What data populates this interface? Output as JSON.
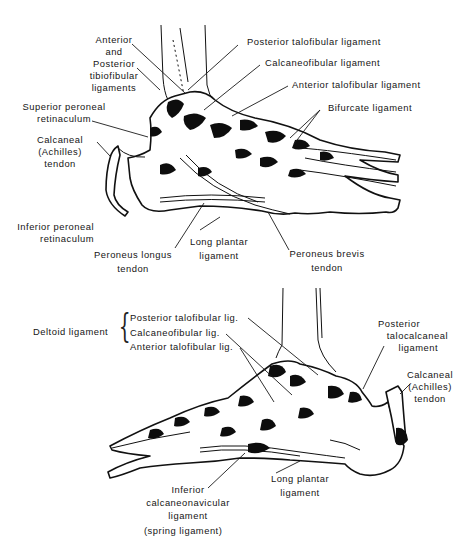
{
  "figure": {
    "top_view": {
      "description": "Lateral view of ankle and foot ligaments",
      "labels": [
        {
          "id": "ant-post-tibiofibular",
          "lines": [
            "Anterior",
            "and",
            "Posterior",
            "tibiofibular",
            "ligaments"
          ]
        },
        {
          "id": "superior-peroneal-retinaculum",
          "lines": [
            "Superior peroneal",
            "retinaculum"
          ]
        },
        {
          "id": "calcaneal-achilles-tendon",
          "lines": [
            "Calcaneal",
            "(Achilles)",
            "tendon"
          ]
        },
        {
          "id": "inferior-peroneal-retinaculum",
          "lines": [
            "Inferior peroneal",
            "retinaculum"
          ]
        },
        {
          "id": "peroneus-longus-tendon",
          "lines": [
            "Peroneus longus",
            "tendon"
          ]
        },
        {
          "id": "long-plantar-ligament",
          "lines": [
            "Long plantar",
            "ligament"
          ]
        },
        {
          "id": "peroneus-brevis-tendon",
          "lines": [
            "Peroneus brevis",
            "tendon"
          ]
        },
        {
          "id": "posterior-talofibular-ligament",
          "lines": [
            "Posterior talofibular ligament"
          ]
        },
        {
          "id": "calcaneofibular-ligament",
          "lines": [
            "Calcaneofibular ligament"
          ]
        },
        {
          "id": "anterior-talofibular-ligament",
          "lines": [
            "Anterior talofibular ligament"
          ]
        },
        {
          "id": "bifurcate-ligament",
          "lines": [
            "Bifurcate ligament"
          ]
        }
      ]
    },
    "bottom_view": {
      "description": "Medial view of ankle and foot ligaments",
      "group_label": "Deltoid ligament",
      "group_items": [
        "Posterior talofibular lig.",
        "Calcaneofibular lig.",
        "Anterior talofibular lig."
      ],
      "labels": [
        {
          "id": "posterior-talocalcaneal-ligament",
          "lines": [
            "Posterior",
            "talocalcaneal",
            "ligament"
          ]
        },
        {
          "id": "calcaneal-achilles-tendon",
          "lines": [
            "Calcaneal",
            "(Achilles)",
            "tendon"
          ]
        },
        {
          "id": "long-plantar-ligament",
          "lines": [
            "Long plantar",
            "ligament"
          ]
        },
        {
          "id": "inferior-calcaneonavicular-ligament",
          "lines": [
            "Inferior",
            "calcaneonavicular",
            "ligament",
            "(spring ligament)"
          ]
        }
      ]
    }
  }
}
